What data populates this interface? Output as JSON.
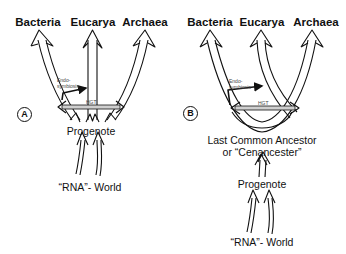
{
  "panels": [
    {
      "id": "A",
      "marker": "A",
      "domains": [
        "Bacteria",
        "Eucarya",
        "Archaea"
      ],
      "endosymbiosis_label": "Endo-\nsymbiosis",
      "hgt_label": "HGT",
      "root_node": "Progenote",
      "origin": "“RNA”- World"
    },
    {
      "id": "B",
      "marker": "B",
      "domains": [
        "Bacteria",
        "Eucarya",
        "Archaea"
      ],
      "endosymbiosis_label": "Endo-\nsymbiosis",
      "hgt_label": "HGT",
      "lca_node": "Last Common Ancestor",
      "lca_alias": "or “Cenancester”",
      "root_node": "Progenote",
      "origin": "“RNA”- World"
    }
  ],
  "colors": {
    "stroke": "#111111",
    "fill": "#ffffff",
    "hgt_band": "#cfcfcf"
  }
}
